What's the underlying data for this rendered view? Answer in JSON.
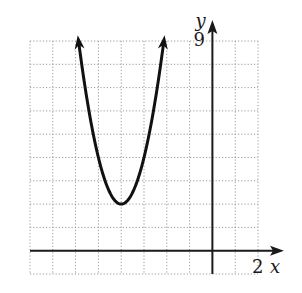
{
  "chart_data": {
    "type": "line",
    "title": "",
    "xlabel": "x",
    "ylabel": "y",
    "xlim": [
      -8,
      2
    ],
    "ylim": [
      -1,
      9
    ],
    "grid": true,
    "grid_step": 1,
    "tick_labels": {
      "x": [
        "2"
      ],
      "y": [
        "9"
      ]
    },
    "tick_label_values": {
      "x": [
        2
      ],
      "y": [
        9
      ]
    },
    "series": [
      {
        "name": "parabola",
        "equation": "y = 2(x + 4)^2 + 2",
        "vertex": [
          -4,
          2
        ],
        "x_range": [
          -5.87,
          -2.13
        ],
        "arrows_at_both_ends": true
      }
    ]
  },
  "colors": {
    "curve": "#111111",
    "axis": "#1a1a1a",
    "grid": "#9a9a9a"
  }
}
